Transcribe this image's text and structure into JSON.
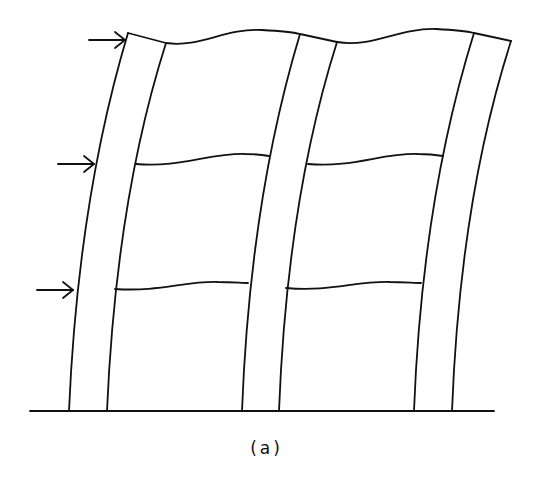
{
  "figure": {
    "caption": "(a)",
    "colors": {
      "line": "#111111",
      "background": "#ffffff"
    }
  },
  "ground": {
    "x1": 30,
    "x2": 494,
    "y": 411
  },
  "columns": [
    {
      "name": "column-left-outer",
      "d": "M 69 411 Q 78 200 128 33"
    },
    {
      "name": "column-left-inner",
      "d": "M 107 411 Q 116 200 166 43"
    },
    {
      "name": "column-mid-outer",
      "d": "M 242 411 Q 250 200 300 34"
    },
    {
      "name": "column-mid-inner",
      "d": "M 279 411 Q 287 200 337 42"
    },
    {
      "name": "column-right-outer",
      "d": "M 414 411 Q 422 200 474 33"
    },
    {
      "name": "column-right-inner",
      "d": "M 452 411 Q 460 200 511 41"
    }
  ],
  "beams": [
    {
      "name": "roof-beam-left-cap",
      "d": "M 128 33 L 166 43"
    },
    {
      "name": "roof-beam-left-bay",
      "d": "M 166 43 C 200 48, 225 28, 262 30 C 280 31, 292 32, 300 34"
    },
    {
      "name": "roof-beam-mid-cap",
      "d": "M 300 34 L 337 42"
    },
    {
      "name": "roof-beam-right-bay",
      "d": "M 337 42 C 372 48, 398 28, 436 29 C 455 30, 466 31, 474 33"
    },
    {
      "name": "roof-beam-right-cap",
      "d": "M 474 33 L 511 41"
    },
    {
      "name": "floor2-beam-left-bay",
      "d": "M 136 164 C 180 168, 210 153, 245 154 C 258 154, 264 155, 269 156"
    },
    {
      "name": "floor2-beam-right-bay",
      "d": "M 308 164 C 352 168, 382 153, 418 154 C 430 154, 437 155, 443 156"
    },
    {
      "name": "floor1-beam-left-bay",
      "d": "M 115 289 C 160 292, 185 281, 218 282 C 232 282, 242 283, 248 283"
    },
    {
      "name": "floor1-beam-right-bay",
      "d": "M 286 288 C 330 292, 356 281, 390 282 C 404 282, 414 283, 421 283"
    }
  ],
  "loads": [
    {
      "name": "load-arrow-roof",
      "x1": 89,
      "x2": 125,
      "y": 40
    },
    {
      "name": "load-arrow-floor2",
      "x1": 58,
      "x2": 94,
      "y": 164
    },
    {
      "name": "load-arrow-floor1",
      "x1": 37,
      "x2": 73,
      "y": 290
    }
  ]
}
